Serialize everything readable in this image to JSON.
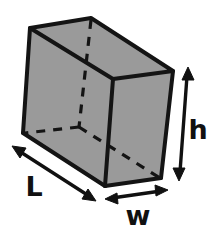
{
  "figure": {
    "title": "Rectangular prism with labeled dimensions",
    "shape_name": "rectangular-prism",
    "background_color": "#ffffff",
    "fill_color": "#9a9a9a",
    "line_color": "#141414",
    "labels": {
      "length": "L",
      "width": "w",
      "height": "h"
    },
    "label_positions": {
      "length": {
        "x": 34,
        "y": 188
      },
      "width": {
        "x": 138,
        "y": 216
      },
      "height": {
        "x": 197,
        "y": 131
      }
    },
    "vertices": {
      "front_top_left": {
        "x": 30,
        "y": 28
      },
      "front_top_right": {
        "x": 113,
        "y": 79
      },
      "front_bottom_left": {
        "x": 23,
        "y": 133
      },
      "front_bottom_right": {
        "x": 105,
        "y": 186
      },
      "back_top_left": {
        "x": 91,
        "y": 18
      },
      "back_top_right": {
        "x": 173,
        "y": 71
      },
      "back_bottom_left": {
        "x": 79,
        "y": 127
      },
      "back_bottom_right": {
        "x": 161,
        "y": 178
      }
    },
    "hidden_edges": [
      "back-top-left-to-back-bottom-left",
      "back-bottom-left-to-front-bottom-left",
      "back-bottom-left-to-back-bottom-right"
    ],
    "dimension_arrows": {
      "length": {
        "from": {
          "x": 14,
          "y": 148
        },
        "to": {
          "x": 94,
          "y": 200
        },
        "style": "double-headed"
      },
      "width": {
        "from": {
          "x": 107,
          "y": 199
        },
        "to": {
          "x": 167,
          "y": 190
        },
        "style": "double-headed"
      },
      "height": {
        "from": {
          "x": 188,
          "y": 69
        },
        "to": {
          "x": 179,
          "y": 178
        },
        "style": "double-headed"
      }
    }
  }
}
